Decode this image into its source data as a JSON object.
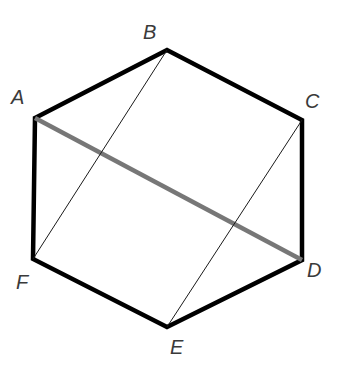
{
  "diagram": {
    "vertices": [
      {
        "name": "A",
        "x": 35,
        "y": 118,
        "lx": 11,
        "ly": 104
      },
      {
        "name": "B",
        "x": 167,
        "y": 50,
        "lx": 143,
        "ly": 39
      },
      {
        "name": "C",
        "x": 302,
        "y": 120,
        "lx": 305,
        "ly": 108
      },
      {
        "name": "D",
        "x": 302,
        "y": 260,
        "lx": 307,
        "ly": 277
      },
      {
        "name": "E",
        "x": 167,
        "y": 327,
        "lx": 170,
        "ly": 354
      },
      {
        "name": "F",
        "x": 33,
        "y": 259,
        "lx": 16,
        "ly": 289
      }
    ],
    "edges": [
      {
        "from": "A",
        "to": "B",
        "style": "thick"
      },
      {
        "from": "B",
        "to": "C",
        "style": "thick"
      },
      {
        "from": "C",
        "to": "D",
        "style": "thick"
      },
      {
        "from": "D",
        "to": "E",
        "style": "thick"
      },
      {
        "from": "E",
        "to": "F",
        "style": "thick"
      },
      {
        "from": "F",
        "to": "A",
        "style": "thick"
      }
    ],
    "diagonals": [
      {
        "from": "A",
        "to": "D",
        "style": "gray-thick"
      },
      {
        "from": "B",
        "to": "F",
        "style": "thin"
      },
      {
        "from": "C",
        "to": "E",
        "style": "thin"
      }
    ],
    "colors": {
      "edge": "#000000",
      "highlight": "#777777",
      "thin": "#1a1a1a",
      "label": "#3a3a3a"
    }
  }
}
